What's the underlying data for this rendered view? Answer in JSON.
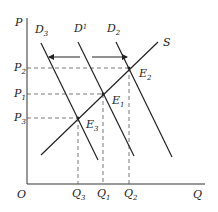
{
  "diagram": {
    "type": "supply-demand",
    "axes": {
      "y_label": "P",
      "x_label": "Q",
      "origin_label": "O"
    },
    "supply_label": "S",
    "demand_curves": [
      {
        "label": "D",
        "sub": "3"
      },
      {
        "label": "D",
        "sub": "1"
      },
      {
        "label": "D",
        "sub": "2"
      }
    ],
    "equilibria": [
      {
        "label": "E",
        "sub": "2"
      },
      {
        "label": "E",
        "sub": "1"
      },
      {
        "label": "E",
        "sub": "3"
      }
    ],
    "prices": [
      {
        "label": "P",
        "sub": "2"
      },
      {
        "label": "P",
        "sub": "1"
      },
      {
        "label": "P",
        "sub": "3"
      }
    ],
    "quantities": [
      {
        "label": "Q",
        "sub": "3"
      },
      {
        "label": "Q",
        "sub": "1"
      },
      {
        "label": "Q",
        "sub": "2"
      }
    ],
    "colors": {
      "line": "#222222",
      "dash": "#555555"
    }
  }
}
